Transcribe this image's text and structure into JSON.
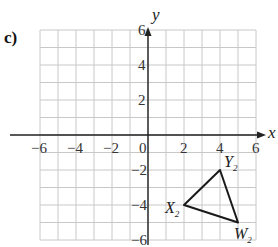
{
  "part_label": "c)",
  "axes": {
    "x_label": "x",
    "y_label": "y",
    "x_ticks": [
      "−6",
      "−4",
      "−2",
      "0",
      "2",
      "4",
      "6"
    ],
    "y_ticks_positive": [
      "6",
      "4",
      "2"
    ],
    "y_ticks_negative": [
      "−2",
      "−4",
      "−6"
    ],
    "origin_label": "0",
    "range": {
      "x": [
        -6,
        6
      ],
      "y": [
        -6,
        6
      ]
    }
  },
  "triangle": {
    "name": "W2X2Y2",
    "vertices": [
      {
        "name": "X",
        "sub": "2",
        "x": 2,
        "y": -4
      },
      {
        "name": "Y",
        "sub": "2",
        "x": 4,
        "y": -2
      },
      {
        "name": "W",
        "sub": "2",
        "x": 5,
        "y": -5
      }
    ]
  },
  "colors": {
    "grid": "#c8c8c8",
    "axis": "#222222",
    "shape": "#1a1a1a"
  }
}
